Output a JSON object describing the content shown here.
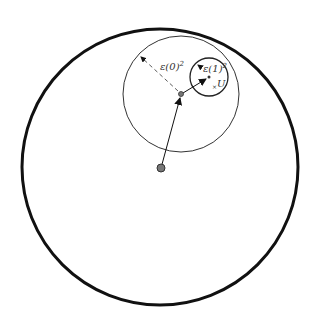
{
  "diagram": {
    "labels": {
      "radius_outer": "ε(0)",
      "radius_outer_exp": "2",
      "radius_inner": "ε(1)",
      "radius_inner_exp": "2",
      "set_label": "U",
      "set_marker": "×"
    },
    "colors": {
      "stroke": "#111111",
      "dot_fill": "#777777"
    }
  }
}
